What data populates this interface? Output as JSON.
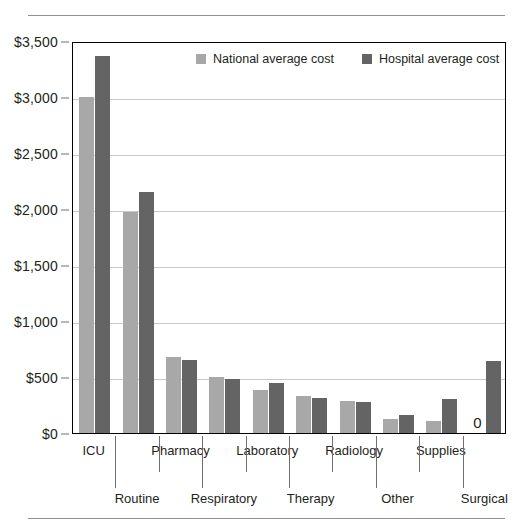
{
  "chart_data": {
    "type": "bar",
    "title": "",
    "xlabel": "",
    "ylabel": "",
    "ylim": [
      0,
      3500
    ],
    "grid": true,
    "legend_position": "top-center",
    "categories": [
      "ICU",
      "Routine",
      "Pharmacy",
      "Respiratory",
      "Laboratory",
      "Therapy",
      "Radiology",
      "Other",
      "Supplies",
      "Surgical"
    ],
    "ytick_labels": [
      "$0",
      "$500",
      "$1,000",
      "$1,500",
      "$2,000",
      "$2,500",
      "$3,000",
      "$3,500"
    ],
    "ytick_values": [
      0,
      500,
      1000,
      1500,
      2000,
      2500,
      3000,
      3500
    ],
    "series": [
      {
        "name": "National average cost",
        "color": "#a8a8a8",
        "values": [
          3000,
          1970,
          680,
          500,
          380,
          330,
          290,
          125,
          110,
          0
        ]
      },
      {
        "name": "Hospital average cost",
        "color": "#646464",
        "values": [
          3370,
          2150,
          650,
          485,
          450,
          315,
          280,
          165,
          300,
          640
        ]
      }
    ],
    "annotations": [
      {
        "text": "0",
        "category": "Surgical",
        "series": "National average cost",
        "value": 0
      }
    ]
  },
  "legend": {
    "items": [
      {
        "label": "National average cost",
        "swatch": "national-swatch"
      },
      {
        "label": "Hospital average cost",
        "swatch": "hospital-swatch"
      }
    ]
  }
}
